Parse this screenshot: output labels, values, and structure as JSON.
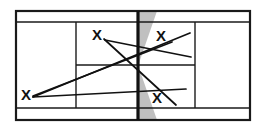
{
  "diagram": {
    "court": {
      "surface_color": "#ffffff",
      "line_color": "#1a1a1a",
      "net_color": "#111111",
      "net_shadow_color": "#9a9a9a",
      "outer_bounds": {
        "x1": 16,
        "y1": 11,
        "x2": 250,
        "y2": 120
      },
      "doubles_alley_top_y": 22,
      "doubles_alley_bottom_y": 108,
      "net_x": 138,
      "service_line_left_x": 76,
      "service_line_right_x": 195,
      "center_service_line_y": 65
    },
    "player_marks": [
      {
        "id": "x-upper-left",
        "label": "X",
        "x": 97,
        "y": 36
      },
      {
        "id": "x-upper-right",
        "label": "X",
        "x": 161,
        "y": 37
      },
      {
        "id": "x-left-baseline",
        "label": "X",
        "x": 26,
        "y": 96
      },
      {
        "id": "x-lower-right",
        "label": "X",
        "x": 157,
        "y": 99
      }
    ],
    "shot_lines": [
      {
        "id": "shot-upper-left-to-lower-right",
        "x1": 104,
        "y1": 39,
        "x2": 176,
        "y2": 105
      },
      {
        "id": "shot-upper-left-to-right-mid",
        "x1": 105,
        "y1": 40,
        "x2": 191,
        "y2": 57
      },
      {
        "id": "shot-right-upper-to-left-baseline",
        "x1": 190,
        "y1": 33,
        "x2": 33,
        "y2": 97
      },
      {
        "id": "shot-left-baseline-to-right-upper-inner",
        "x1": 33,
        "y1": 96,
        "x2": 172,
        "y2": 42
      },
      {
        "id": "shot-left-baseline-to-right-lower",
        "x1": 33,
        "y1": 97,
        "x2": 186,
        "y2": 89
      }
    ],
    "net_shading": {
      "top_wedge": "M 138,11 L 156,11 L 138,62 Z",
      "bottom_wedge": "M 138,69 L 138,120 L 156,120 Z"
    }
  }
}
